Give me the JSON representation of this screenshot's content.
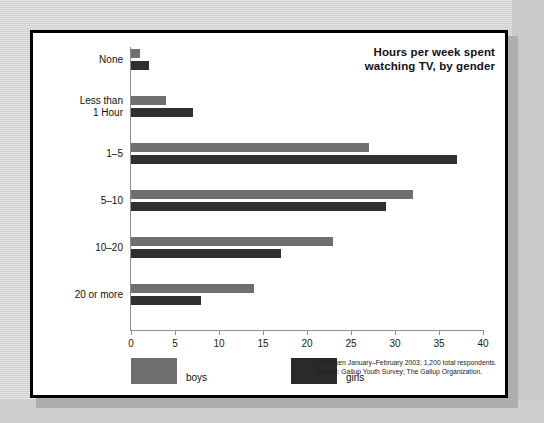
{
  "chart_data": {
    "type": "bar",
    "orientation": "horizontal",
    "title": "Hours per week spent watching TV, by gender",
    "title_line1": "Hours per week spent",
    "title_line2": "watching TV, by gender",
    "categories": [
      "None",
      "Less than 1 Hour",
      "1–5",
      "5–10",
      "10–20",
      "20 or more"
    ],
    "category_labels": [
      [
        "None"
      ],
      [
        "Less than",
        "1 Hour"
      ],
      [
        "1–5"
      ],
      [
        "5–10"
      ],
      [
        "10–20"
      ],
      [
        "20 or more"
      ]
    ],
    "series": [
      {
        "name": "boys",
        "color": "#6f6f6f",
        "values": [
          1,
          4,
          27,
          32,
          23,
          14
        ]
      },
      {
        "name": "girls",
        "color": "#2f2f2f",
        "values": [
          2,
          7,
          37,
          29,
          17,
          8
        ]
      }
    ],
    "xlabel": "",
    "ylabel": "",
    "xlim": [
      0,
      40
    ],
    "xticks": [
      0,
      5,
      10,
      15,
      20,
      25,
      30,
      35,
      40
    ],
    "xtick_labels": [
      "0",
      "5",
      "10",
      "15",
      "20",
      "25",
      "30",
      "35",
      "40"
    ],
    "grid": false,
    "legend_position": "bottom-left",
    "legend": [
      "boys",
      "girls"
    ],
    "source_line1": "Poll taken January–February 2003; 1,200 total respondents.",
    "source_line2": "Source: Gallup Youth Survey; The Gallup Organization."
  },
  "colors": {
    "background": "#d4d4d4",
    "panel": "#ffffff",
    "frame": "#000000",
    "boys": "#6f6f6f",
    "girls": "#2f2f2f",
    "axis": "#8d8d8d",
    "text": "#111111"
  }
}
